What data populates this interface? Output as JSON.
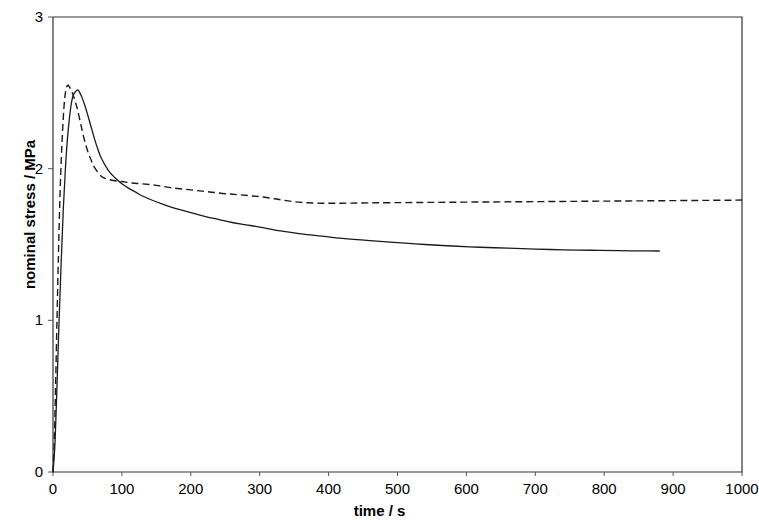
{
  "chart_data": {
    "type": "line",
    "title": "",
    "subtitle": "",
    "xlabel": "time / s",
    "ylabel": "nominal stress / MPa",
    "xlim": [
      0,
      1000
    ],
    "ylim": [
      0,
      3
    ],
    "xticks": [
      0,
      100,
      200,
      300,
      400,
      500,
      600,
      700,
      800,
      900,
      1000
    ],
    "yticks": [
      0,
      1,
      2,
      3
    ],
    "xtick_labels": [
      "0",
      "100",
      "200",
      "300",
      "400",
      "500",
      "600",
      "700",
      "800",
      "900",
      "1000"
    ],
    "ytick_labels": [
      "0",
      "1",
      "2",
      "3"
    ],
    "grid": false,
    "legend": null,
    "legend_position": "none",
    "frame": "box",
    "series": [
      {
        "name": "dashed curve",
        "style": "dashed",
        "color": "#1a1a1a",
        "x": [
          0,
          2,
          4,
          6,
          8,
          10,
          12,
          14,
          16,
          18,
          20,
          22,
          25,
          28,
          31,
          35,
          40,
          45,
          50,
          55,
          60,
          70,
          80,
          90,
          100,
          115,
          130,
          150,
          170,
          190,
          210,
          230,
          250,
          270,
          290,
          310,
          330,
          350,
          370,
          390,
          410,
          430,
          450,
          470,
          500,
          530,
          560,
          590,
          620,
          650,
          680,
          710,
          740,
          770,
          800,
          830,
          860,
          890,
          920,
          950,
          980,
          1000
        ],
        "y": [
          0.0,
          0.22,
          0.62,
          1.05,
          1.45,
          1.8,
          2.06,
          2.26,
          2.41,
          2.5,
          2.54,
          2.55,
          2.53,
          2.5,
          2.46,
          2.4,
          2.3,
          2.2,
          2.12,
          2.06,
          2.01,
          1.95,
          1.93,
          1.92,
          1.915,
          1.905,
          1.9,
          1.89,
          1.875,
          1.865,
          1.855,
          1.845,
          1.835,
          1.828,
          1.82,
          1.81,
          1.795,
          1.782,
          1.775,
          1.772,
          1.772,
          1.773,
          1.774,
          1.775,
          1.776,
          1.777,
          1.778,
          1.779,
          1.78,
          1.781,
          1.782,
          1.783,
          1.784,
          1.785,
          1.786,
          1.787,
          1.788,
          1.789,
          1.79,
          1.791,
          1.792,
          1.793
        ]
      },
      {
        "name": "solid curve",
        "style": "solid",
        "color": "#1a1a1a",
        "x": [
          0,
          3,
          6,
          9,
          12,
          15,
          18,
          21,
          24,
          27,
          30,
          33,
          36,
          39,
          42,
          46,
          50,
          55,
          60,
          65,
          70,
          80,
          90,
          100,
          110,
          120,
          130,
          145,
          160,
          180,
          200,
          220,
          240,
          260,
          280,
          300,
          330,
          360,
          390,
          420,
          460,
          500,
          540,
          580,
          620,
          660,
          700,
          740,
          780,
          820,
          850,
          880
        ],
        "y": [
          0.0,
          0.2,
          0.6,
          1.02,
          1.4,
          1.74,
          2.0,
          2.2,
          2.34,
          2.44,
          2.49,
          2.51,
          2.52,
          2.5,
          2.47,
          2.42,
          2.36,
          2.28,
          2.2,
          2.13,
          2.07,
          1.99,
          1.94,
          1.9,
          1.87,
          1.845,
          1.82,
          1.79,
          1.765,
          1.735,
          1.71,
          1.685,
          1.665,
          1.645,
          1.63,
          1.615,
          1.59,
          1.57,
          1.555,
          1.54,
          1.525,
          1.512,
          1.5,
          1.49,
          1.482,
          1.476,
          1.47,
          1.465,
          1.462,
          1.46,
          1.458,
          1.457
        ]
      }
    ],
    "annotations": []
  }
}
